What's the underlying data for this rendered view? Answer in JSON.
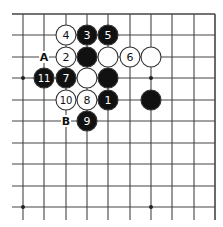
{
  "board": {
    "background": "#ffffff",
    "line_color": "#444444",
    "columns_x": [
      23,
      44,
      66,
      87,
      108,
      130,
      151,
      172,
      194,
      215
    ],
    "rows_y": [
      14,
      35,
      57,
      78,
      100,
      121,
      143,
      164,
      186,
      207
    ],
    "h_line_x_start": 12,
    "h_line_x_end": 215,
    "v_line_y_end": 220,
    "top_edge": true,
    "right_edge": true,
    "star_points": [
      {
        "col": 0,
        "row": 3
      },
      {
        "col": 6,
        "row": 3
      },
      {
        "col": 0,
        "row": 9
      },
      {
        "col": 6,
        "row": 9
      }
    ],
    "stone_radius": 10
  },
  "stones": [
    {
      "color": "white",
      "col": 2,
      "row": 1,
      "label": "4"
    },
    {
      "color": "black",
      "col": 3,
      "row": 1,
      "label": "3"
    },
    {
      "color": "black",
      "col": 4,
      "row": 1,
      "label": "5"
    },
    {
      "color": "white",
      "col": 2,
      "row": 2,
      "label": "2"
    },
    {
      "color": "black",
      "col": 3,
      "row": 2,
      "label": ""
    },
    {
      "color": "white",
      "col": 4,
      "row": 2,
      "label": ""
    },
    {
      "color": "white",
      "col": 5,
      "row": 2,
      "label": "6"
    },
    {
      "color": "white",
      "col": 6,
      "row": 2,
      "label": ""
    },
    {
      "color": "black",
      "col": 1,
      "row": 3,
      "label": "11"
    },
    {
      "color": "black",
      "col": 2,
      "row": 3,
      "label": "7"
    },
    {
      "color": "white",
      "col": 3,
      "row": 3,
      "label": ""
    },
    {
      "color": "black",
      "col": 4,
      "row": 3,
      "label": ""
    },
    {
      "color": "white",
      "col": 2,
      "row": 4,
      "label": "10"
    },
    {
      "color": "white",
      "col": 3,
      "row": 4,
      "label": "8"
    },
    {
      "color": "black",
      "col": 4,
      "row": 4,
      "label": "1"
    },
    {
      "color": "black",
      "col": 6,
      "row": 4,
      "label": ""
    },
    {
      "color": "black",
      "col": 3,
      "row": 5,
      "label": "9"
    }
  ],
  "markers": [
    {
      "col": 1,
      "row": 2,
      "label": "A"
    },
    {
      "col": 2,
      "row": 5,
      "label": "B"
    }
  ]
}
